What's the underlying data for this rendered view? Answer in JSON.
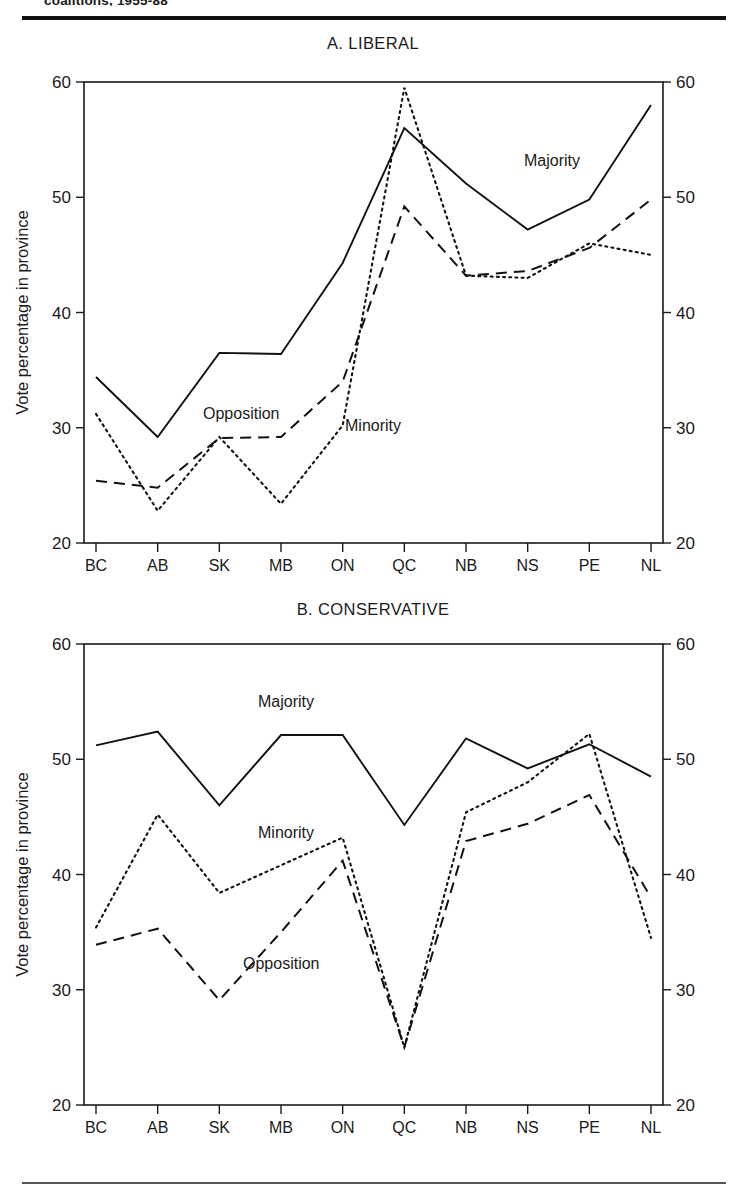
{
  "running_head": "coalitions, 1955-88",
  "axis": {
    "y_label": "Vote percentage in province",
    "y_ticks": [
      20,
      30,
      40,
      50,
      60
    ],
    "y_min": 20,
    "y_max": 60,
    "categories": [
      "BC",
      "AB",
      "SK",
      "MB",
      "ON",
      "QC",
      "NB",
      "NS",
      "PE",
      "NL"
    ]
  },
  "panel_a": {
    "title": "A. LIBERAL",
    "annotations": [
      {
        "text": "Majority",
        "x": 524,
        "y": 166
      },
      {
        "text": "Opposition",
        "x": 203,
        "y": 419
      },
      {
        "text": "Minority",
        "x": 345,
        "y": 431
      }
    ]
  },
  "panel_b": {
    "title": "B. CONSERVATIVE",
    "annotations": [
      {
        "text": "Majority",
        "x": 258,
        "y": 707
      },
      {
        "text": "Minority",
        "x": 258,
        "y": 838
      },
      {
        "text": "Opposition",
        "x": 243,
        "y": 969
      }
    ]
  },
  "chart_data": [
    {
      "type": "line",
      "title": "A. LIBERAL",
      "xlabel": "",
      "ylabel": "Vote percentage in province",
      "ylim": [
        20,
        60
      ],
      "yticks": [
        20,
        30,
        40,
        50,
        60
      ],
      "grid": false,
      "legend": "inline-annotations",
      "categories": [
        "BC",
        "AB",
        "SK",
        "MB",
        "ON",
        "QC",
        "NB",
        "NS",
        "PE",
        "NL"
      ],
      "series": [
        {
          "name": "Majority",
          "style": "solid",
          "values": [
            34.4,
            29.2,
            36.5,
            36.4,
            44.3,
            56.0,
            51.2,
            47.2,
            49.8,
            58.0
          ]
        },
        {
          "name": "Minority",
          "style": "dotted",
          "values": [
            31.2,
            22.8,
            29.2,
            23.4,
            30.2,
            59.5,
            43.2,
            43.0,
            46.0,
            45.0
          ]
        },
        {
          "name": "Opposition",
          "style": "dashed",
          "values": [
            25.4,
            24.8,
            29.1,
            29.2,
            34.0,
            49.2,
            43.2,
            43.6,
            45.6,
            49.8
          ]
        }
      ]
    },
    {
      "type": "line",
      "title": "B. CONSERVATIVE",
      "xlabel": "",
      "ylabel": "Vote percentage in province",
      "ylim": [
        20,
        60
      ],
      "yticks": [
        20,
        30,
        40,
        50,
        60
      ],
      "grid": false,
      "legend": "inline-annotations",
      "categories": [
        "BC",
        "AB",
        "SK",
        "MB",
        "ON",
        "QC",
        "NB",
        "NS",
        "PE",
        "NL"
      ],
      "series": [
        {
          "name": "Majority",
          "style": "solid",
          "values": [
            51.2,
            52.4,
            46.0,
            52.1,
            52.1,
            44.3,
            51.8,
            49.2,
            51.3,
            48.5
          ]
        },
        {
          "name": "Minority",
          "style": "dotted",
          "values": [
            35.4,
            45.2,
            38.4,
            40.8,
            43.2,
            25.0,
            45.4,
            48.0,
            52.2,
            34.5
          ]
        },
        {
          "name": "Opposition",
          "style": "dashed",
          "values": [
            33.9,
            35.3,
            29.1,
            35.0,
            41.2,
            25.0,
            42.9,
            44.4,
            46.9,
            38.0
          ]
        }
      ]
    }
  ]
}
